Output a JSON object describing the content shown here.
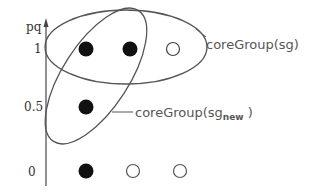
{
  "diagram": {
    "axis": {
      "label": "pq",
      "ticks": [
        {
          "label": "1",
          "y": 49
        },
        {
          "label": "0.5",
          "y": 107
        },
        {
          "label": "0",
          "y": 172
        }
      ]
    },
    "points": [
      {
        "row": "1",
        "x": 86,
        "y": 49,
        "filled": true
      },
      {
        "row": "1",
        "x": 130,
        "y": 49,
        "filled": true
      },
      {
        "row": "1",
        "x": 173,
        "y": 49,
        "filled": false
      },
      {
        "row": "0.5",
        "x": 86,
        "y": 107,
        "filled": true
      },
      {
        "row": "0",
        "x": 86,
        "y": 171,
        "filled": true
      },
      {
        "row": "0",
        "x": 133,
        "y": 171,
        "filled": false
      },
      {
        "row": "0",
        "x": 180,
        "y": 171,
        "filled": false
      }
    ],
    "groups": [
      {
        "label_main": "coreGroup(sg)",
        "label_sub": ""
      },
      {
        "label_main": "coreGroup(sg",
        "label_sub": "new",
        "label_close": " )"
      }
    ],
    "colors": {
      "stroke": "#555555",
      "fill": "#111111",
      "text": "#555555"
    }
  }
}
